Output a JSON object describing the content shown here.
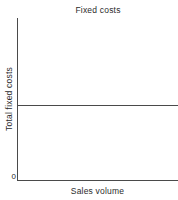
{
  "chart_data": {
    "type": "line",
    "title": "Fixed costs",
    "xlabel": "Sales volume",
    "ylabel": "Total fixed costs",
    "series": [
      {
        "name": "Fixed costs",
        "x": [
          0,
          100
        ],
        "values": [
          46,
          46
        ]
      }
    ],
    "xlim": [
      0,
      100
    ],
    "ylim": [
      0,
      100
    ],
    "xticks": [],
    "xticklabels": [],
    "yticks": [
      0
    ],
    "yticklabels": [
      "0"
    ],
    "grid": false,
    "legend": false,
    "line_color": "#4a4a4a",
    "axis_color": "#4a4a4a",
    "background_color": "#ffffff",
    "annotations": []
  },
  "axes": {
    "origin_label": "0"
  }
}
